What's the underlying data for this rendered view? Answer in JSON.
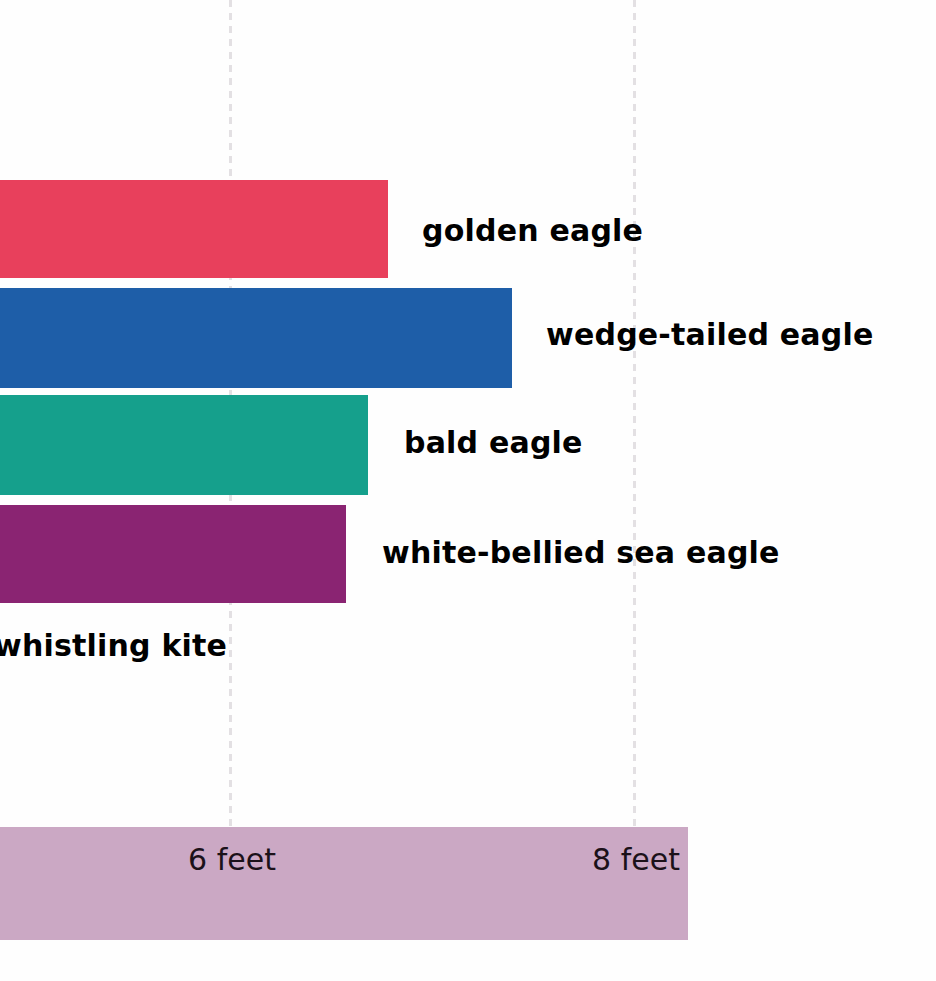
{
  "chart_data": {
    "type": "bar",
    "orientation": "horizontal",
    "title": "",
    "xlabel": "",
    "ylabel": "",
    "unit": "feet",
    "categories": [
      "golden eagle",
      "wedge-tailed eagle",
      "bald eagle",
      "white-bellied sea eagle",
      "whistling kite"
    ],
    "values": [
      6.8,
      7.4,
      6.7,
      6.6,
      null
    ],
    "colors": [
      "#e8405c",
      "#1e5ea8",
      "#15a08c",
      "#8a2472",
      null
    ],
    "tick_labels": [
      "6 feet",
      "8 feet"
    ],
    "tick_values": [
      6,
      8
    ],
    "grid": true,
    "legend": false,
    "note": "Image is cropped: bars start off the left edge and the whistling kite bar is not visible."
  },
  "axis": {
    "band_color": "#cba8c4",
    "gridline_color": "#e3e0e3",
    "ticks": [
      {
        "label": "6 feet",
        "value": 6,
        "x": 232
      },
      {
        "label": "8 feet",
        "value": 8,
        "x": 636
      }
    ]
  },
  "bars": [
    {
      "name": "golden eagle",
      "label": "golden eagle",
      "color": "#e8405c",
      "value": 6.8,
      "top": 180,
      "height": 98,
      "bar_width": 388,
      "label_x": 422,
      "label_y": 216
    },
    {
      "name": "wedge-tailed eagle",
      "label": "wedge-tailed eagle",
      "color": "#1e5ea8",
      "value": 7.4,
      "top": 288,
      "height": 100,
      "bar_width": 512,
      "label_x": 546,
      "label_y": 320
    },
    {
      "name": "bald eagle",
      "label": "bald eagle",
      "color": "#15a08c",
      "value": 6.7,
      "top": 395,
      "height": 100,
      "bar_width": 368,
      "label_x": 404,
      "label_y": 428
    },
    {
      "name": "white-bellied sea eagle",
      "label": "white-bellied sea eagle",
      "color": "#8a2472",
      "value": 6.6,
      "top": 505,
      "height": 98,
      "bar_width": 346,
      "label_x": 382,
      "label_y": 538
    },
    {
      "name": "whistling kite",
      "label": "whistling kite",
      "color": null,
      "value": null,
      "top": null,
      "height": null,
      "bar_width": 0,
      "label_x": -6,
      "label_y": 631
    }
  ],
  "gridlines": [
    {
      "name": "gridline-6-feet",
      "x": 229
    },
    {
      "name": "gridline-8-feet",
      "x": 633
    }
  ]
}
